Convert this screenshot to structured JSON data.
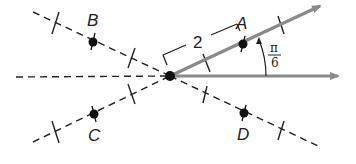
{
  "diagram": {
    "type": "polar-rays-with-symmetric-points",
    "origin": {
      "x": 170,
      "y": 76
    },
    "points": [
      {
        "name": "A",
        "label": "A",
        "angle_deg": 30,
        "r": 2
      },
      {
        "name": "B",
        "label": "B",
        "angle_deg": 150,
        "r": 2
      },
      {
        "name": "C",
        "label": "C",
        "angle_deg": 210,
        "r": 2
      },
      {
        "name": "D",
        "label": "D",
        "angle_deg": 330,
        "r": 2
      }
    ],
    "distance_label": "2",
    "angle_label": {
      "numerator": "π",
      "denominator": "6"
    },
    "colors": {
      "ray": "#8a8a8a",
      "dashed": "#222222",
      "point": "#111111"
    }
  }
}
